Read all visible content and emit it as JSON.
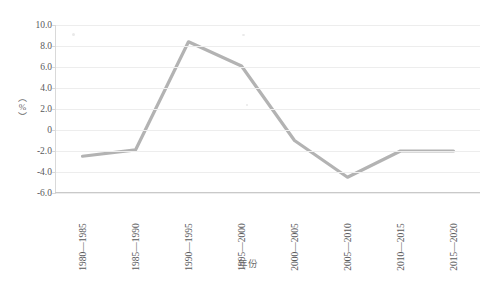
{
  "chart_data": {
    "type": "line",
    "title": "",
    "xlabel": "年份",
    "ylabel": "（%）",
    "categories": [
      "1980—1985",
      "1985—1990",
      "1990—1995",
      "1995—2000",
      "2000—2005",
      "2005—2010",
      "2010—2015",
      "2015—2020"
    ],
    "values": [
      -2.5,
      -1.9,
      8.4,
      6.1,
      -1.0,
      -4.5,
      -2.0,
      -2.0
    ],
    "series": [
      {
        "name": "",
        "values": [
          -2.5,
          -1.9,
          8.4,
          6.1,
          -1.0,
          -4.5,
          -2.0,
          -2.0
        ]
      }
    ],
    "ylim": [
      -6.0,
      10.0
    ],
    "yticks": [
      10.0,
      8.0,
      6.0,
      4.0,
      2.0,
      0,
      -2.0,
      -4.0,
      -6.0
    ],
    "ytick_labels": [
      "10.0",
      "8.0",
      "6.0",
      "4.0",
      "2.0",
      "0",
      "-2.0",
      "-4.0",
      "-6.0"
    ],
    "grid": true,
    "legend": false,
    "legend_position": "none",
    "line_color": "#b3b3b3",
    "grid_color": "#ededed",
    "axis_color": "#d0d0d0",
    "background_color": "#ffffff"
  }
}
